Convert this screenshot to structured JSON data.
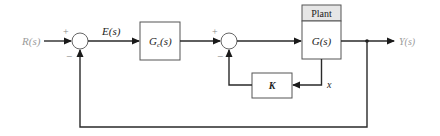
{
  "diagram": {
    "type": "block-diagram",
    "colors": {
      "line": "#2a2a2a",
      "box_stroke": "#555555",
      "plant_header_fill": "#e6e6e6",
      "io_label": "#9a9a9a",
      "text": "#222222"
    },
    "input": {
      "label": "R(s)"
    },
    "output": {
      "label": "Y(s)"
    },
    "error_signal": {
      "label": "E(s)"
    },
    "summing_junctions": [
      {
        "id": "sum1",
        "plus": "+",
        "minus": "−"
      },
      {
        "id": "sum2",
        "plus": "+",
        "minus": "−"
      }
    ],
    "blocks": {
      "controller": {
        "label_main": "G",
        "label_sub": "c",
        "label_arg": "(s)"
      },
      "plant": {
        "header": "Plant",
        "label": "G(s)"
      },
      "feedback_gain": {
        "label": "K"
      }
    },
    "state_signal": {
      "label": "x"
    }
  }
}
